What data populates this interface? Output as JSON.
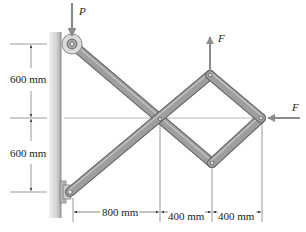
{
  "figure": {
    "type": "mechanism-linkage"
  },
  "forces": {
    "P": {
      "label": "P",
      "direction": "down",
      "color": "#8c8c8c"
    },
    "F_vertical": {
      "label": "F",
      "direction": "up",
      "color": "#8c8c8c"
    },
    "F_horizontal": {
      "label": "F",
      "direction": "left",
      "color": "#8c8c8c"
    }
  },
  "dimensions": {
    "vertical": [
      {
        "label": "600 mm"
      },
      {
        "label": "600 mm"
      }
    ],
    "horizontal": [
      {
        "label": "800 mm"
      },
      {
        "label": "400 mm"
      },
      {
        "label": "400 mm"
      }
    ]
  },
  "colors": {
    "member_fill": "#9a9a9a",
    "member_edge": "#5e5e5e",
    "wall_fill": "#d8d8d8",
    "dim_line": "#333333",
    "arrow": "#8c8c8c"
  }
}
